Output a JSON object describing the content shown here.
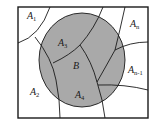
{
  "diagram": {
    "type": "venn-partition",
    "colors": {
      "background": "#ffffff",
      "shaded_event": "#a9a9a9",
      "stroke": "#1a1a1a"
    },
    "event_label": "B",
    "regions": [
      {
        "id": "A1",
        "base": "A",
        "sub": "1"
      },
      {
        "id": "A2",
        "base": "A",
        "sub": "2"
      },
      {
        "id": "A3",
        "base": "A",
        "sub": "3"
      },
      {
        "id": "A4",
        "base": "A",
        "sub": "4"
      },
      {
        "id": "An",
        "base": "A",
        "sub": "n"
      },
      {
        "id": "An-1",
        "base": "A",
        "sub": "n-1"
      }
    ]
  }
}
